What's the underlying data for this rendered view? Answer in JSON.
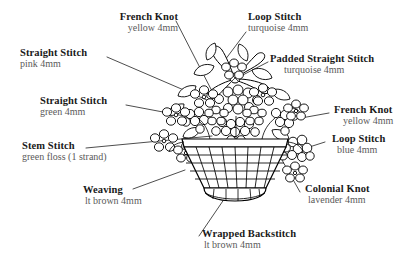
{
  "diagram": {
    "illustration_name": "flower-basket-illustration",
    "line_color": "#000000",
    "title_color": "#1a1a1a",
    "subtitle_color": "#5a5a5a",
    "background": "#ffffff"
  },
  "callouts": [
    {
      "id": "french-knot-yellow-top",
      "title": "French Knot",
      "sub": "yellow 4mm",
      "align": "right"
    },
    {
      "id": "loop-stitch-turquoise",
      "title": "Loop Stitch",
      "sub": "turquoise 4mm",
      "align": "left"
    },
    {
      "id": "straight-stitch-pink",
      "title": "Straight Stitch",
      "sub": "pink 4mm",
      "align": "left"
    },
    {
      "id": "padded-straight-stitch",
      "title": "Padded Straight Stitch",
      "sub": "turquoise 4mm",
      "align": "left"
    },
    {
      "id": "straight-stitch-green",
      "title": "Straight Stitch",
      "sub": "green 4mm",
      "align": "left"
    },
    {
      "id": "french-knot-yellow-right",
      "title": "French Knot",
      "sub": "yellow 4mm",
      "align": "left"
    },
    {
      "id": "loop-stitch-blue",
      "title": "Loop Stitch",
      "sub": "blue 4mm",
      "align": "left"
    },
    {
      "id": "stem-stitch-green-floss",
      "title": "Stem Stitch",
      "sub": "green floss (1 strand)",
      "align": "left"
    },
    {
      "id": "colonial-knot-lavender",
      "title": "Colonial Knot",
      "sub": "lavender 4mm",
      "align": "left"
    },
    {
      "id": "weaving-lt-brown",
      "title": "Weaving",
      "sub": "lt brown 4mm",
      "align": "left"
    },
    {
      "id": "wrapped-backstitch",
      "title": "Wrapped Backstitch",
      "sub": "lt brown 4mm",
      "align": "left"
    }
  ]
}
